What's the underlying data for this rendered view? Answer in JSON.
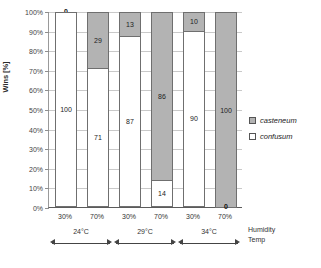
{
  "chart_data": {
    "type": "bar",
    "subtype": "stacked-100-percent",
    "title": "",
    "xlabel": "Humidity\nTemp",
    "ylabel": "Wins [%]",
    "ylim": [
      0,
      100
    ],
    "ytick_labels": [
      "100%",
      "90%",
      "80%",
      "70%",
      "60%",
      "50%",
      "40%",
      "30%",
      "20%",
      "10%",
      "0%"
    ],
    "ytick_values": [
      100,
      90,
      80,
      70,
      60,
      50,
      40,
      30,
      20,
      10,
      0
    ],
    "grid": true,
    "legend_position": "right",
    "categories": [
      "30%",
      "70%",
      "30%",
      "70%",
      "30%",
      "70%"
    ],
    "groups": [
      {
        "label": "24°C",
        "categories": [
          "30%",
          "70%"
        ]
      },
      {
        "label": "29°C",
        "categories": [
          "30%",
          "70%"
        ]
      },
      {
        "label": "34°C",
        "categories": [
          "30%",
          "70%"
        ]
      }
    ],
    "series": [
      {
        "name": "casteneum",
        "color": "#b3b3b3",
        "values": [
          0,
          29,
          13,
          86,
          10,
          100
        ]
      },
      {
        "name": "confusum",
        "color": "#ffffff",
        "values": [
          100,
          71,
          87,
          14,
          90,
          0
        ]
      }
    ],
    "bars": [
      {
        "group": "24°C",
        "humidity": "30%",
        "casteneum": 0,
        "confusum": 100
      },
      {
        "group": "24°C",
        "humidity": "70%",
        "casteneum": 29,
        "confusum": 71
      },
      {
        "group": "29°C",
        "humidity": "30%",
        "casteneum": 13,
        "confusum": 87
      },
      {
        "group": "29°C",
        "humidity": "70%",
        "casteneum": 86,
        "confusum": 14
      },
      {
        "group": "34°C",
        "humidity": "30%",
        "casteneum": 10,
        "confusum": 90
      },
      {
        "group": "34°C",
        "humidity": "70%",
        "casteneum": 100,
        "confusum": 0
      }
    ]
  },
  "axis": {
    "y_title": "Wins [%]",
    "ticks": [
      {
        "label": "100%",
        "value": 100
      },
      {
        "label": "90%",
        "value": 90
      },
      {
        "label": "80%",
        "value": 80
      },
      {
        "label": "70%",
        "value": 70
      },
      {
        "label": "60%",
        "value": 60
      },
      {
        "label": "50%",
        "value": 50
      },
      {
        "label": "40%",
        "value": 40
      },
      {
        "label": "30%",
        "value": 30
      },
      {
        "label": "20%",
        "value": 20
      },
      {
        "label": "10%",
        "value": 10
      },
      {
        "label": "0%",
        "value": 0
      }
    ],
    "x_caption_line1": "Humidity",
    "x_caption_line2": "Temp"
  },
  "legend": {
    "items": [
      {
        "label": "casteneum",
        "swatch": "fill-a"
      },
      {
        "label": "confusum",
        "swatch": "fill-b"
      }
    ]
  }
}
